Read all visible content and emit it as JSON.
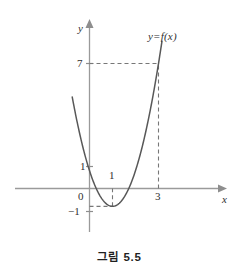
{
  "figure": {
    "caption": "그림 5.5",
    "curve_label": "y=f(x)",
    "axis_labels": {
      "x": "x",
      "y": "y"
    },
    "tick_labels": {
      "origin": "0",
      "y_one": "1",
      "y_seven": "7",
      "y_minus_one": "−1",
      "x_one": "1",
      "x_three": "3"
    }
  },
  "chart_data": {
    "type": "line",
    "title": "그림 5.5",
    "xlabel": "x",
    "ylabel": "y",
    "grid": false,
    "legend": "none",
    "annotations": [
      "y=f(x)"
    ],
    "xlim": [
      -0.95,
      3.9
    ],
    "ylim": [
      -1.6,
      9.2
    ],
    "xticks": [
      0,
      1,
      3
    ],
    "xticklabels": [
      "0",
      "1",
      "3"
    ],
    "yticks": [
      -1,
      1,
      7
    ],
    "yticklabels": [
      "−1",
      "1",
      "7"
    ],
    "series": [
      {
        "name": "y=f(x)",
        "equation": "f(x) = 2(x-1)^2 - 1",
        "vertex": [
          1,
          -1
        ],
        "x": [
          -0.75,
          -0.5,
          -0.25,
          0,
          0.25,
          0.5,
          0.75,
          1,
          1.25,
          1.5,
          1.75,
          2,
          2.25,
          2.5,
          2.75,
          3,
          3.15
        ],
        "y": [
          5.125,
          3.5,
          2.125,
          1,
          0.125,
          -0.5,
          -0.875,
          -1,
          -0.875,
          -0.5,
          0.125,
          1,
          2.125,
          3.5,
          5.125,
          7,
          8.245
        ]
      }
    ],
    "guide_lines": [
      {
        "type": "horizontal",
        "value": 7,
        "from_x": 0,
        "to_x": 3,
        "style": "dashed"
      },
      {
        "type": "vertical",
        "value": 3,
        "from_y": 0,
        "to_y": 7,
        "style": "dashed"
      },
      {
        "type": "horizontal",
        "value": -1,
        "from_x": 0,
        "to_x": 1,
        "style": "dashed"
      },
      {
        "type": "vertical",
        "value": 1,
        "from_y": -1,
        "to_y": 0,
        "style": "dashed"
      }
    ]
  },
  "colors": {
    "curve": "#585858",
    "axis": "#9a9a9a",
    "dashed": "#777777",
    "text": "#2f2f2f",
    "background": "#ffffff"
  }
}
